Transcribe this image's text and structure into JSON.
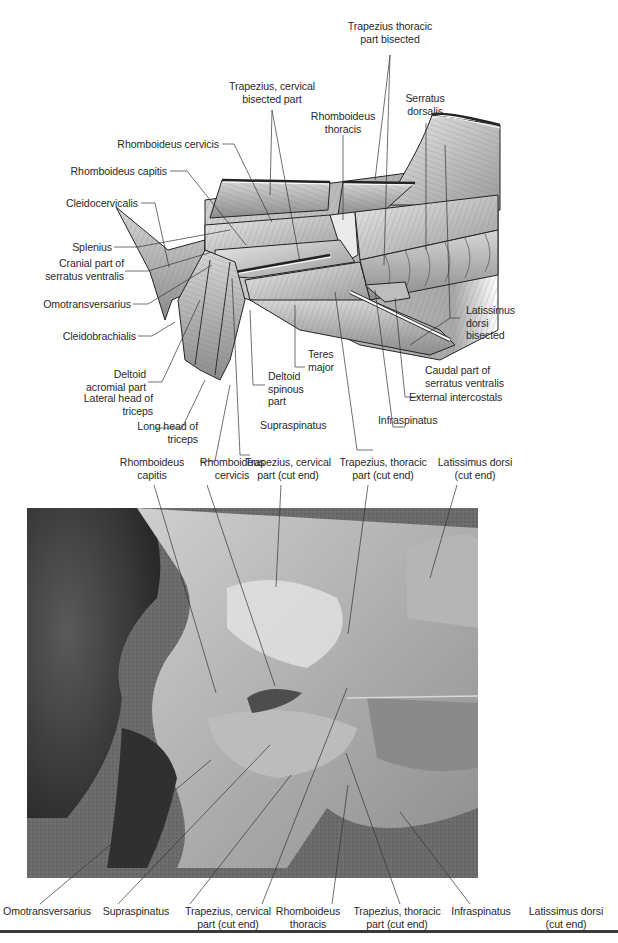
{
  "figure": {
    "illustration": {
      "description": "Lateral view line drawing of superficial shoulder and neck muscles with bisected trapezius and latissimus",
      "labels": [
        {
          "id": "trapezius-thoracic-bisected",
          "text": "Trapezius thoracic\npart bisected"
        },
        {
          "id": "trapezius-cervical-bisected",
          "text": "Trapezius, cervical\nbisected part"
        },
        {
          "id": "serratus-dorsalis",
          "text": "Serratus\ndorsalis"
        },
        {
          "id": "rhomboideus-thoracis",
          "text": "Rhomboideus\nthoracis"
        },
        {
          "id": "rhomboideus-cervicis",
          "text": "Rhomboideus cervicis"
        },
        {
          "id": "rhomboideus-capitis",
          "text": "Rhomboideus capitis"
        },
        {
          "id": "cleidocervicalis",
          "text": "Cleidocervicalis"
        },
        {
          "id": "splenius",
          "text": "Splenius"
        },
        {
          "id": "cranial-serratus-ventralis",
          "text": "Cranial part of\nserratus ventralis"
        },
        {
          "id": "omotransversarius",
          "text": "Omotransversarius"
        },
        {
          "id": "cleidobrachialis",
          "text": "Cleidobrachialis"
        },
        {
          "id": "deltoid-acromial",
          "text": "Deltoid\nacromial part"
        },
        {
          "id": "lateral-head-triceps",
          "text": "Lateral head of\ntriceps"
        },
        {
          "id": "long-head-triceps",
          "text": "Long head of\ntriceps"
        },
        {
          "id": "teres-major",
          "text": "Teres\nmajor"
        },
        {
          "id": "deltoid-spinous",
          "text": "Deltoid\nspinous\npart"
        },
        {
          "id": "supraspinatus",
          "text": "Supraspinatus"
        },
        {
          "id": "infraspinatus",
          "text": "Infraspinatus"
        },
        {
          "id": "external-intercostals",
          "text": "External intercostals"
        },
        {
          "id": "caudal-serratus-ventralis",
          "text": "Caudal part of\nserratus ventralis"
        },
        {
          "id": "latissimus-bisected",
          "text": "Latissimus\ndorsi\nbisected"
        }
      ]
    },
    "photo": {
      "description": "Grayscale dissection photograph showing the corresponding muscles with cut ends",
      "top_labels": [
        {
          "id": "rhomboideus-capitis",
          "text": "Rhomboideus\ncapitis"
        },
        {
          "id": "rhomboideus-cervicis",
          "text": "Rhomboideus\ncervicis"
        },
        {
          "id": "trapezius-cervical-cut",
          "text": "Trapezius, cervical\npart (cut end)"
        },
        {
          "id": "trapezius-thoracic-cut",
          "text": "Trapezius, thoracic\npart (cut end)"
        },
        {
          "id": "latissimus-cut",
          "text": "Latissimus dorsi\n(cut end)"
        }
      ],
      "bottom_labels": [
        {
          "id": "omotransversarius",
          "text": "Omotransversarius"
        },
        {
          "id": "supraspinatus",
          "text": "Supraspinatus"
        },
        {
          "id": "trapezius-cervical-cut",
          "text": "Trapezius, cervical\npart (cut end)"
        },
        {
          "id": "rhomboideus-thoracis",
          "text": "Rhomboideus\nthoracis"
        },
        {
          "id": "trapezius-thoracic-cut",
          "text": "Trapezius, thoracic\npart (cut end)"
        },
        {
          "id": "infraspinatus",
          "text": "Infraspinatus"
        },
        {
          "id": "latissimus-cut",
          "text": "Latissimus dorsi\n(cut end)"
        }
      ]
    }
  }
}
